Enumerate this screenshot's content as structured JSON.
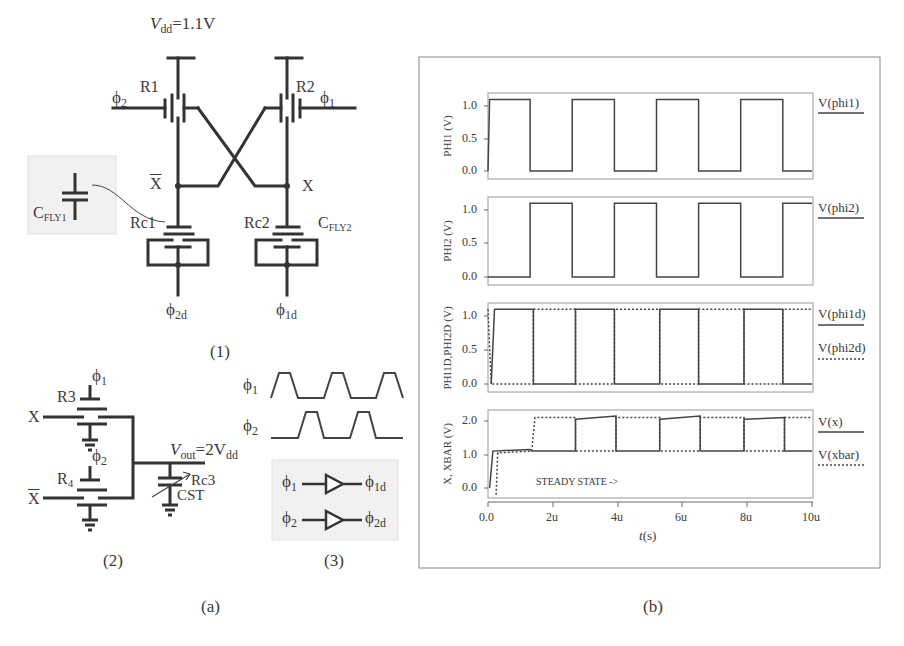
{
  "panel_a": {
    "caption": "(a)",
    "circuit1": {
      "caption": "(1)",
      "vdd_label_main": "V",
      "vdd_label_sub": "dd",
      "vdd_label_value": "=1.1V",
      "r1": "R1",
      "r2": "R2",
      "phi2_in": "ϕ",
      "phi2_in_sub": "2",
      "phi1_in": "ϕ",
      "phi1_in_sub": "1",
      "xbar": "X",
      "x": "X",
      "rc1": "Rc1",
      "rc2": "Rc2",
      "cfly1_main": "C",
      "cfly1_sub": "FLY1",
      "cfly2_main": "C",
      "cfly2_sub": "FLY2",
      "phi2d": "ϕ",
      "phi2d_sub": "2d",
      "phi1d": "ϕ",
      "phi1d_sub": "1d"
    },
    "circuit2": {
      "caption": "(2)",
      "r3": "R3",
      "r4_main": "R",
      "r4_sub": "4",
      "phi1": "ϕ",
      "phi1_sub": "1",
      "phi2": "ϕ",
      "phi2_sub": "2",
      "x": "X",
      "xbar": "X",
      "vout_main": "V",
      "vout_sub": "out",
      "vout_eq": "=2V",
      "vout_eq_sub": "dd",
      "rc3": "Rc3",
      "cst": "CST"
    },
    "circuit3": {
      "caption": "(3)",
      "phi1": "ϕ",
      "phi1_sub": "1",
      "phi2": "ϕ",
      "phi2_sub": "2",
      "phi1d": "ϕ",
      "phi1d_sub": "1d",
      "phi2d": "ϕ",
      "phi2d_sub": "2d"
    }
  },
  "panel_b": {
    "caption": "(b)",
    "xlabel_italic": "t",
    "xlabel_rest": "(s)",
    "x_ticks": [
      "0.0",
      "2u",
      "4u",
      "6u",
      "8u",
      "10u"
    ],
    "annotation": "STEADY STATE ->"
  },
  "chart_data": [
    {
      "type": "line",
      "ylabel": "PHI1 (V)",
      "legend": [
        {
          "name": "V(phi1)",
          "style": "solid"
        }
      ],
      "y_ticks": [
        "0.0",
        "0.5",
        "1.0"
      ],
      "ylim": [
        -0.05,
        1.2
      ],
      "xlim": [
        0,
        10
      ],
      "x_unit": "us",
      "series": [
        {
          "name": "V(phi1)",
          "x": [
            0,
            0.05,
            1.3,
            1.3,
            2.6,
            2.6,
            3.9,
            3.9,
            5.2,
            5.2,
            6.5,
            6.5,
            7.8,
            7.8,
            9.1,
            9.1,
            10
          ],
          "y": [
            0,
            1.1,
            1.1,
            0,
            0,
            1.1,
            1.1,
            0,
            0,
            1.1,
            1.1,
            0,
            0,
            1.1,
            1.1,
            0,
            0
          ]
        }
      ]
    },
    {
      "type": "line",
      "ylabel": "PHI2 (V)",
      "legend": [
        {
          "name": "V(phi2)",
          "style": "solid"
        }
      ],
      "y_ticks": [
        "0.0",
        "0.5",
        "1.0"
      ],
      "ylim": [
        -0.05,
        1.2
      ],
      "xlim": [
        0,
        10
      ],
      "series": [
        {
          "name": "V(phi2)",
          "x": [
            0,
            1.3,
            1.3,
            2.6,
            2.6,
            3.9,
            3.9,
            5.2,
            5.2,
            6.5,
            6.5,
            7.8,
            7.8,
            9.1,
            9.1,
            10
          ],
          "y": [
            0,
            0,
            1.1,
            1.1,
            0,
            0,
            1.1,
            1.1,
            0,
            0,
            1.1,
            1.1,
            0,
            0,
            1.1,
            1.1
          ]
        }
      ]
    },
    {
      "type": "line",
      "ylabel": "PHI1D,PHI2D (V)",
      "legend": [
        {
          "name": "V(phi1d)",
          "style": "solid"
        },
        {
          "name": "V(phi2d)",
          "style": "dashed"
        }
      ],
      "y_ticks": [
        "0.0",
        "0.5",
        "1.0"
      ],
      "ylim": [
        -0.05,
        1.2
      ],
      "xlim": [
        0,
        10
      ],
      "series": [
        {
          "name": "V(phi1d)",
          "x": [
            0.1,
            0.2,
            1.4,
            1.4,
            2.7,
            2.7,
            3.9,
            3.9,
            5.3,
            5.3,
            6.5,
            6.5,
            7.9,
            7.9,
            9.1,
            9.1,
            10
          ],
          "y": [
            0,
            1.1,
            1.1,
            0,
            0,
            1.1,
            1.1,
            0,
            0,
            1.1,
            1.1,
            0,
            0,
            1.1,
            1.1,
            0,
            0
          ]
        },
        {
          "name": "V(phi2d)",
          "x": [
            0,
            0.1,
            1.4,
            1.4,
            2.7,
            2.7,
            3.9,
            3.9,
            5.3,
            5.3,
            6.5,
            6.5,
            7.9,
            7.9,
            9.1,
            9.1,
            10
          ],
          "y": [
            1.1,
            0,
            0,
            1.1,
            1.1,
            0,
            0,
            1.1,
            1.1,
            0,
            0,
            1.1,
            1.1,
            0,
            0,
            1.1,
            1.1
          ]
        }
      ]
    },
    {
      "type": "line",
      "ylabel": "X, XBAR (V)",
      "legend": [
        {
          "name": "V(x)",
          "style": "solid"
        },
        {
          "name": "V(xbar)",
          "style": "dashed"
        }
      ],
      "y_ticks": [
        "0.0",
        "1.0",
        "2.0"
      ],
      "ylim": [
        -0.2,
        2.3
      ],
      "xlim": [
        0,
        10
      ],
      "annotation": "STEADY STATE ->",
      "series": [
        {
          "name": "V(x)",
          "x": [
            0.05,
            0.15,
            1.3,
            1.35,
            1.35,
            2.7,
            2.7,
            3.95,
            3.95,
            5.3,
            5.3,
            6.55,
            6.55,
            7.9,
            7.9,
            9.15,
            9.15,
            10
          ],
          "y": [
            0,
            1.1,
            1.15,
            1.1,
            1.1,
            1.1,
            2.05,
            2.15,
            1.1,
            1.1,
            2.05,
            2.15,
            1.1,
            1.1,
            2.05,
            2.1,
            1.1,
            1.1
          ]
        },
        {
          "name": "V(xbar)",
          "x": [
            0.25,
            0.3,
            1.35,
            1.45,
            2.7,
            2.7,
            3.95,
            3.95,
            5.3,
            5.3,
            6.55,
            6.55,
            7.9,
            7.9,
            9.15,
            9.15,
            10
          ],
          "y": [
            -0.2,
            1.05,
            1.1,
            2.1,
            2.1,
            1.1,
            1.1,
            2.1,
            2.1,
            1.1,
            1.1,
            2.1,
            2.1,
            1.1,
            1.1,
            2.1,
            2.1
          ]
        }
      ]
    }
  ]
}
